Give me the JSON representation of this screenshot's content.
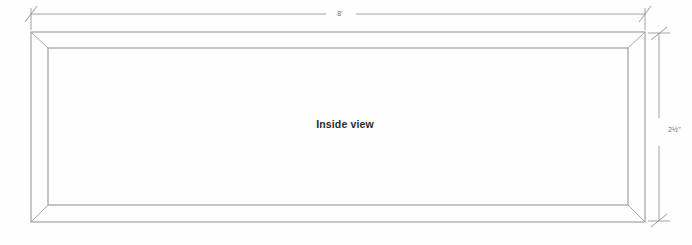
{
  "drawing": {
    "title": "Inside view",
    "center_label": "Inside view",
    "dimensions": {
      "width_label": "8'",
      "height_label": "2½\""
    },
    "colors": {
      "frame_stroke": "#8d8d8d",
      "miter_stroke": "#a8a8a8",
      "dimension_stroke": "#8d8d8d",
      "background": "#fefefe",
      "label_text": "#6f6f6f",
      "center_text": "#2c2c2c"
    },
    "geometry": {
      "outer": {
        "x1": 31,
        "y1": 32,
        "x2": 645,
        "y2": 222
      },
      "inner": {
        "x1": 48,
        "y1": 48,
        "x2": 628,
        "y2": 205
      },
      "width_dim_line_y": 14,
      "height_dim_line_x": 659
    }
  }
}
